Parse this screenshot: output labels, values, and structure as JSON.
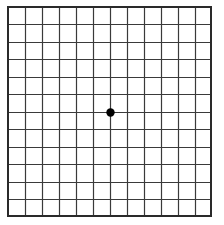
{
  "grid": {
    "title": "Amsler grid",
    "columns": 12,
    "rows": 12,
    "line_color": "#3a3a3a",
    "border_color": "#2a2a2a",
    "background": "#ffffff",
    "center_dot": {
      "color": "#000000",
      "column": 6,
      "row": 6
    }
  }
}
